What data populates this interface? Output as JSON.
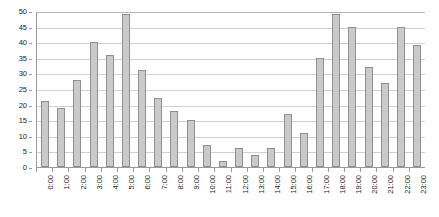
{
  "chart_data": {
    "type": "bar",
    "title": "",
    "subtitle": "",
    "xlabel": "",
    "ylabel": "",
    "categories": [
      "0:00",
      "1:00",
      "2:00",
      "3:00",
      "4:00",
      "5:00",
      "6:00",
      "7:00",
      "8:00",
      "9:00",
      "10:00",
      "11:00",
      "12:00",
      "13:00",
      "14:00",
      "15:00",
      "16:00",
      "17:00",
      "18:00",
      "19:00",
      "20:00",
      "21:00",
      "22:00",
      "23:00"
    ],
    "values": [
      21,
      19,
      28,
      40,
      36,
      49,
      31,
      22,
      18,
      15,
      7,
      2,
      6,
      4,
      6,
      17,
      11,
      35,
      49,
      45,
      32,
      27,
      45,
      39
    ],
    "ylim": [
      0,
      50
    ],
    "yticks": [
      0,
      5,
      10,
      15,
      20,
      25,
      30,
      35,
      40,
      45,
      50
    ],
    "ytick_labels": [
      "0",
      "5",
      "10",
      "15",
      "20",
      "25",
      "30",
      "35",
      "40",
      "45",
      "50"
    ],
    "grid": true,
    "grid_axis": "y",
    "legend": false,
    "legend_position": "none",
    "bar_fill_color": "#cacaca",
    "bar_border_color": "#8f8f8f",
    "grid_color": "#d0d0d0",
    "axis_color": "#9a9a9a",
    "background_color": "#ffffff",
    "tick_label_color": "#222222",
    "xtick_label_rotation": 90
  }
}
